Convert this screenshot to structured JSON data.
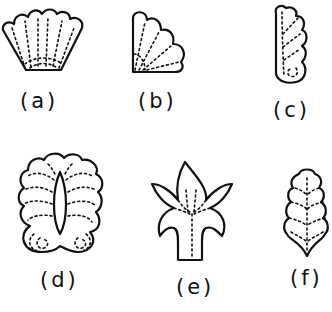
{
  "figures": [
    {
      "id": "a",
      "label": "(a)",
      "shape": "scallop-shell-fan"
    },
    {
      "id": "b",
      "label": "(b)",
      "shape": "quarter-fan"
    },
    {
      "id": "c",
      "label": "(c)",
      "shape": "elongated-scroll-leaf"
    },
    {
      "id": "d",
      "label": "(d)",
      "shape": "palmette"
    },
    {
      "id": "e",
      "label": "(e)",
      "shape": "fleur-de-lis"
    },
    {
      "id": "f",
      "label": "(f)",
      "shape": "scalloped-leaf"
    }
  ],
  "colors": {
    "line": "#111111",
    "background": "#ffffff"
  }
}
